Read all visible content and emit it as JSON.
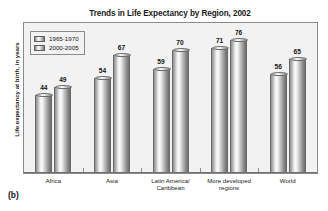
{
  "panel": {
    "letter": "(b)"
  },
  "chart_data": {
    "type": "bar",
    "title": "Trends in Life Expectancy by Region, 2002",
    "xlabel": "",
    "ylabel": "Life expectancy at birth, in years",
    "ylim": [
      0,
      85
    ],
    "grid": false,
    "legend_position": "top-left",
    "categories": [
      "Africa",
      "Latin America/ Caribbean",
      "Asia",
      "More developed regions",
      "World"
    ],
    "category_lines": [
      [
        "Africa"
      ],
      [
        "Asia"
      ],
      [
        "Latin America/",
        "Caribbean"
      ],
      [
        "More developed",
        "regions"
      ],
      [
        "World"
      ]
    ],
    "series": [
      {
        "name": "1965-1970",
        "values": [
          44,
          54,
          59,
          71,
          56
        ]
      },
      {
        "name": "2000-2005",
        "values": [
          49,
          67,
          70,
          76,
          65
        ]
      }
    ]
  }
}
